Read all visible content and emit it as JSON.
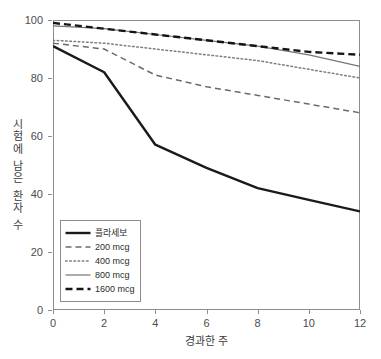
{
  "chart_data": {
    "type": "line",
    "title": "",
    "xlabel": "경과한 주",
    "ylabel": "시험에 남은 환자 수",
    "x": [
      0,
      2,
      4,
      6,
      8,
      10,
      12
    ],
    "xlim": [
      0,
      12
    ],
    "ylim": [
      0,
      100
    ],
    "xticks": [
      "0",
      "2",
      "4",
      "6",
      "8",
      "10",
      "12"
    ],
    "yticks": [
      "0",
      "20",
      "40",
      "60",
      "80",
      "100"
    ],
    "grid": false,
    "legend_position": "lower-left",
    "series": [
      {
        "name": "플라세보",
        "values": [
          91,
          82,
          57,
          49,
          42,
          38,
          34
        ],
        "style": "solid",
        "color": "#1a1a1a",
        "width": 2.4
      },
      {
        "name": "200 mcg",
        "values": [
          92,
          90,
          81,
          77,
          74,
          71,
          68
        ],
        "style": "dashed",
        "color": "#6b6b6b",
        "width": 1.5
      },
      {
        "name": "400 mcg",
        "values": [
          93,
          92,
          90,
          88,
          86,
          83,
          80
        ],
        "style": "dotted",
        "color": "#7d7d7d",
        "width": 1.5
      },
      {
        "name": "800 mcg",
        "values": [
          98,
          97,
          95,
          93,
          91,
          88,
          84
        ],
        "style": "solid",
        "color": "#757575",
        "width": 1.2
      },
      {
        "name": "1600 mcg",
        "values": [
          99,
          97,
          95,
          93,
          91,
          89,
          88
        ],
        "style": "dashed",
        "color": "#141414",
        "width": 2.4
      }
    ]
  },
  "axes": {
    "x_title": "경과한 주",
    "y_title": "시험에 남은 환자 수",
    "x_tick_labels": [
      "0",
      "2",
      "4",
      "6",
      "8",
      "10",
      "12"
    ],
    "y_tick_labels": [
      "0",
      "20",
      "40",
      "60",
      "80",
      "100"
    ]
  },
  "legend": {
    "items": [
      {
        "label": "플라세보"
      },
      {
        "label": "200 mcg"
      },
      {
        "label": "400 mcg"
      },
      {
        "label": "800 mcg"
      },
      {
        "label": "1600 mcg"
      }
    ]
  },
  "colors": {
    "frame": "#8d8d8d",
    "tick_text": "#4d4d4d",
    "title_text": "#3b3b3b",
    "background": "#ffffff"
  }
}
